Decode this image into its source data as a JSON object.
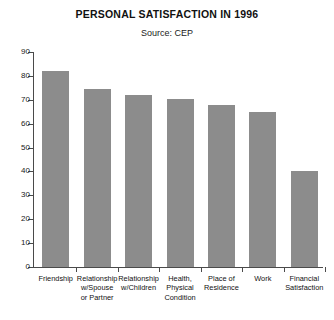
{
  "chart_data": {
    "type": "bar",
    "title": "PERSONAL SATISFACTION IN 1996",
    "subtitle": "Source: CEP",
    "xlabel": "",
    "ylabel": "",
    "ylim": [
      0,
      90
    ],
    "grid": false,
    "legend": "none",
    "bar_color": "#8c8c8c",
    "axis_color": "#4a4a4a",
    "yticks": [
      90,
      80,
      70,
      60,
      50,
      40,
      30,
      20,
      10,
      0
    ],
    "ytick_labels": [
      "90",
      "80",
      "70",
      "60",
      "50",
      "40",
      "30",
      "20",
      "10",
      "0"
    ],
    "categories": [
      "Friendship",
      "Relationship w/Spouse or Partner",
      "Relationship w/Children",
      "Health, Physical Condition",
      "Place of Residence",
      "Work",
      "Financial Satisfaction"
    ],
    "category_label_lines": [
      [
        "Friendship"
      ],
      [
        "Relationship",
        "w/Spouse",
        "or Partner"
      ],
      [
        "Relationship",
        "w/Children"
      ],
      [
        "Health,",
        "Physical",
        "Condition"
      ],
      [
        "Place of",
        "Residence"
      ],
      [
        "Work"
      ],
      [
        "Financial",
        "Satisfaction"
      ]
    ],
    "values": [
      82,
      74.5,
      72,
      70.5,
      68,
      65,
      40
    ]
  }
}
